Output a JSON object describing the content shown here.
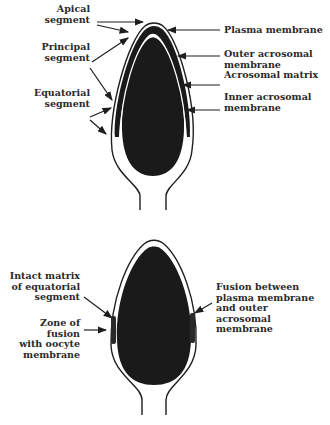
{
  "top_diagram": {
    "title": "Intact sperm head acrosome",
    "left_labels": {
      "apical": "Apical\nsegment",
      "principal": "Principal\nsegment",
      "equatorial": "Equatorial\nsegment"
    },
    "right_labels": {
      "plasma": "Plasma membrane",
      "outer": "Outer acrosomal\nmembrane",
      "matrix": "Acrosomal matrix",
      "inner": "Inner acrosomal\nmembrane"
    }
  },
  "bottom_diagram": {
    "title": "Sperm head after acrosome reaction",
    "left_labels": {
      "intact_matrix": "Intact matrix\nof equatorial\nsegment",
      "zone_fusion": "Zone of\nfusion\nwith oocyte\nmembrane"
    },
    "right_labels": {
      "fusion_between": "Fusion between\nplasma membrane\nand outer\nacrosomal\nmembrane"
    }
  },
  "colors": {
    "ink": "#1e1e1e",
    "background": "#ffffff"
  }
}
